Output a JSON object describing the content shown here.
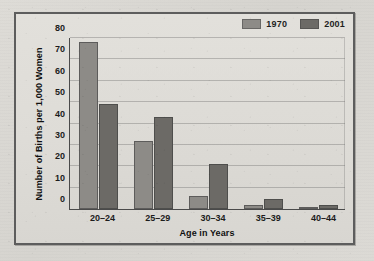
{
  "chart_data": {
    "type": "bar",
    "title": "",
    "xlabel": "Age in Years",
    "ylabel": "Number of Births per 1,000 Women",
    "categories": [
      "20–24",
      "25–29",
      "30–34",
      "35–39",
      "40–44"
    ],
    "series": [
      {
        "name": "1970",
        "color": "#8d8b87",
        "values": [
          78,
          32,
          6,
          2,
          0.6
        ]
      },
      {
        "name": "2001",
        "color": "#6c6a66",
        "values": [
          49,
          43,
          21,
          4.5,
          1.8
        ]
      }
    ],
    "ylim": [
      0,
      80
    ],
    "yticks": [
      0,
      10,
      20,
      30,
      40,
      50,
      60,
      70,
      80
    ],
    "ytick_labels": [
      "0",
      "10",
      "20",
      "30",
      "40",
      "50",
      "60",
      "70",
      "80"
    ],
    "grid": true,
    "legend_position": "top-right"
  },
  "figure": {
    "frame_color": "#5d5d5d",
    "background_color": "#ded f d9"
  }
}
